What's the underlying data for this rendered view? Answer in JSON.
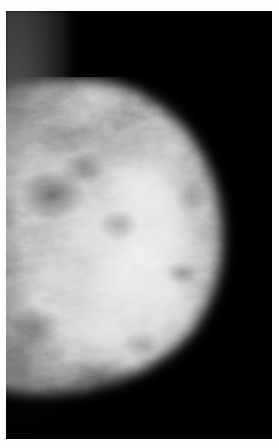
{
  "image": {
    "modality": "mammogram",
    "view_description": "single-breast X-ray, breast profile facing right",
    "background_color": "#000000",
    "frame_color": "#ffffff",
    "tissue_highlight_color": "#d8d8d8",
    "tissue_midtone_color": "#8e8e8e",
    "pectoral_color": "#5a5a5a",
    "width_px": 279,
    "height_px": 448,
    "alt_text": "Grayscale mammography radiograph showing dense fibroglandular breast tissue against a black background"
  },
  "regions": [
    {
      "name": "pectoral-muscle",
      "label": "Pectoral muscle band",
      "position": "left edge, upper two-thirds"
    },
    {
      "name": "fibroglandular-tissue",
      "label": "Dense fibroglandular tissue",
      "position": "center"
    },
    {
      "name": "breast-contour",
      "label": "Skin line / breast contour",
      "position": "right convex border"
    },
    {
      "name": "background",
      "label": "Radiolucent background",
      "position": "upper right and lower right"
    }
  ]
}
